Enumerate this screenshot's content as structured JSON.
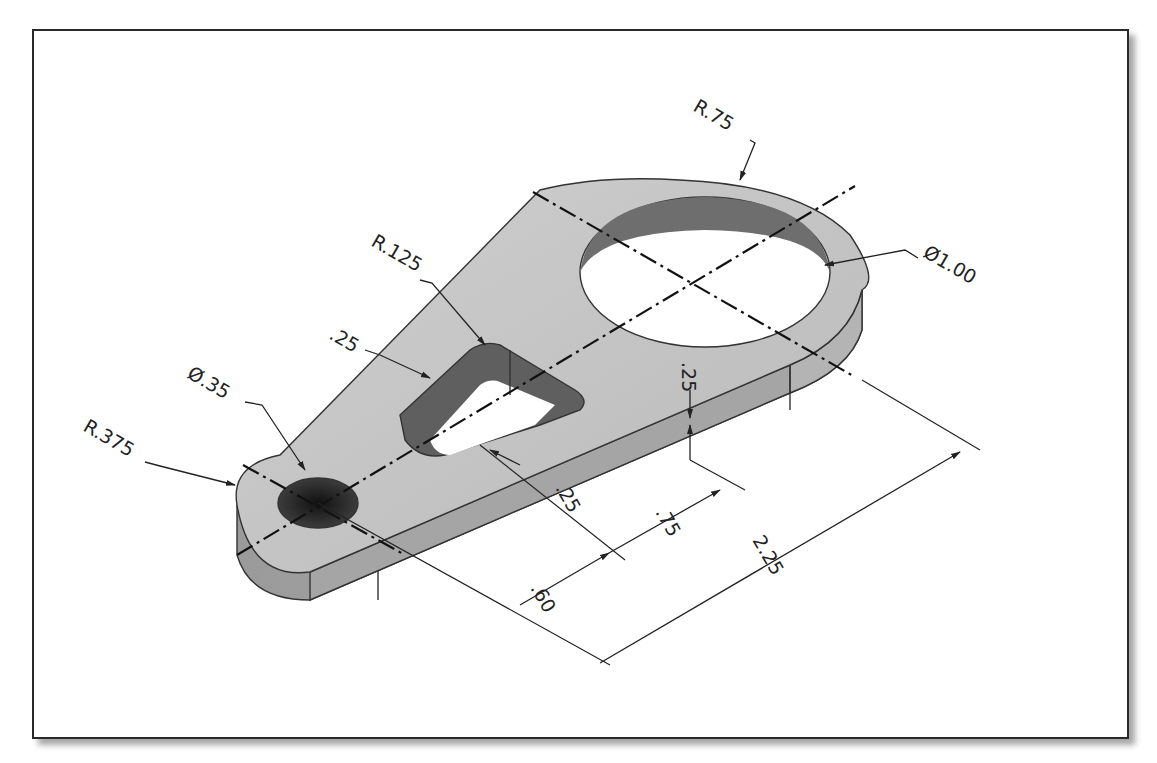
{
  "drawing": {
    "type": "isometric engineering drawing",
    "part": "link/lever plate",
    "colors": {
      "top_face": "#c4c4c4",
      "side_face": "#a9a9a9",
      "front_face": "#9c9c9c",
      "hole_wall": "#6e6e6e",
      "small_hole": "#2e2e2e",
      "lines": "#222222",
      "background": "#ffffff"
    },
    "dimensions": {
      "r_large": "R.75",
      "dia_large": "Ø1.00",
      "r_slot_corner": "R.125",
      "slot_wall_top": ".25",
      "dia_small": "Ø.35",
      "r_small": "R.375",
      "thickness": ".25",
      "slot_wall_bottom": ".25",
      "slot_length": ".75",
      "slot_offset": ".60",
      "center_distance": "2.25"
    }
  }
}
